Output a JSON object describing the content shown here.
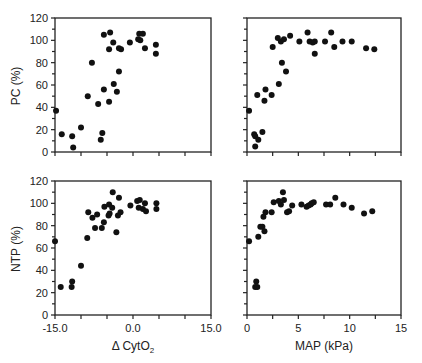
{
  "chart_data": [
    {
      "type": "scatter",
      "panel": "top-left",
      "xlabel": "",
      "ylabel": "PC (%)",
      "xlim": [
        -15,
        15
      ],
      "ylim": [
        0,
        120
      ],
      "xticks": [
        -15,
        -10,
        -5,
        0,
        5,
        10,
        15
      ],
      "xtick_labels": [],
      "yticks": [
        0,
        20,
        40,
        60,
        80,
        100,
        120
      ],
      "ytick_labels": [
        "0",
        "20",
        "40",
        "60",
        "80",
        "100",
        "120"
      ],
      "grid": false,
      "points": [
        [
          -14.8,
          37
        ],
        [
          -13.7,
          16
        ],
        [
          -11.7,
          14
        ],
        [
          -11.5,
          4
        ],
        [
          -10.0,
          22
        ],
        [
          -8.7,
          50
        ],
        [
          -7.9,
          80
        ],
        [
          -6.7,
          43
        ],
        [
          -6.2,
          11
        ],
        [
          -5.9,
          17
        ],
        [
          -5.6,
          56
        ],
        [
          -5.6,
          105
        ],
        [
          -4.4,
          107
        ],
        [
          -4.6,
          45
        ],
        [
          -4.6,
          92
        ],
        [
          -3.8,
          98
        ],
        [
          -3.7,
          61
        ],
        [
          -3.1,
          54
        ],
        [
          -2.7,
          72
        ],
        [
          -2.7,
          93
        ],
        [
          -2.3,
          92
        ],
        [
          -0.6,
          98
        ],
        [
          1.0,
          101
        ],
        [
          1.2,
          106
        ],
        [
          1.9,
          106
        ],
        [
          1.4,
          100
        ],
        [
          2.3,
          93
        ],
        [
          4.4,
          96
        ],
        [
          4.4,
          88
        ]
      ]
    },
    {
      "type": "scatter",
      "panel": "top-right",
      "xlabel": "",
      "ylabel": "",
      "xlim": [
        0,
        15
      ],
      "ylim": [
        0,
        120
      ],
      "xticks": [
        0,
        2.5,
        5,
        7.5,
        10,
        12.5,
        15
      ],
      "xtick_labels": [],
      "yticks": [
        0,
        10,
        20,
        30,
        40,
        50,
        60,
        70,
        80,
        90,
        100,
        110,
        120
      ],
      "ytick_labels": [],
      "grid": false,
      "points": [
        [
          0.2,
          37
        ],
        [
          0.7,
          16
        ],
        [
          0.8,
          14
        ],
        [
          0.8,
          5
        ],
        [
          1.1,
          11
        ],
        [
          1.0,
          51
        ],
        [
          1.5,
          18
        ],
        [
          1.7,
          46
        ],
        [
          1.8,
          56
        ],
        [
          2.4,
          51
        ],
        [
          2.5,
          94
        ],
        [
          3.1,
          61
        ],
        [
          3.0,
          102
        ],
        [
          3.3,
          99
        ],
        [
          3.6,
          101
        ],
        [
          3.4,
          80
        ],
        [
          3.8,
          72
        ],
        [
          4.2,
          104
        ],
        [
          5.1,
          99
        ],
        [
          5.9,
          107
        ],
        [
          6.1,
          99
        ],
        [
          6.4,
          98
        ],
        [
          6.6,
          99
        ],
        [
          6.6,
          88
        ],
        [
          7.6,
          99
        ],
        [
          8.2,
          107
        ],
        [
          8.5,
          94
        ],
        [
          9.3,
          99
        ],
        [
          10.2,
          99
        ],
        [
          11.6,
          93
        ],
        [
          12.4,
          92
        ]
      ]
    },
    {
      "type": "scatter",
      "panel": "bottom-left",
      "xlabel": "Δ CytO2",
      "ylabel": "NTP (%)",
      "xlim": [
        -15,
        15
      ],
      "ylim": [
        0,
        120
      ],
      "xticks": [
        -15,
        -10,
        -5,
        0,
        5,
        10,
        15
      ],
      "xtick_labels": [
        "-15.0",
        "",
        "",
        "0.0",
        "",
        "",
        "15.0"
      ],
      "yticks": [
        0,
        20,
        40,
        60,
        80,
        100,
        120
      ],
      "ytick_labels": [
        "0",
        "20",
        "40",
        "60",
        "80",
        "100",
        "120"
      ],
      "grid": false,
      "points": [
        [
          -15.0,
          66
        ],
        [
          -13.9,
          25
        ],
        [
          -11.8,
          25
        ],
        [
          -11.7,
          30
        ],
        [
          -10.0,
          44
        ],
        [
          -8.8,
          69
        ],
        [
          -8.6,
          92
        ],
        [
          -7.8,
          87
        ],
        [
          -7.3,
          78
        ],
        [
          -6.9,
          90
        ],
        [
          -6.0,
          78
        ],
        [
          -5.6,
          83
        ],
        [
          -5.5,
          97
        ],
        [
          -4.6,
          99
        ],
        [
          -4.7,
          89
        ],
        [
          -4.5,
          91
        ],
        [
          -4.0,
          96
        ],
        [
          -3.9,
          110
        ],
        [
          -3.2,
          74
        ],
        [
          -2.9,
          89
        ],
        [
          -2.7,
          105
        ],
        [
          -2.4,
          92
        ],
        [
          -0.5,
          98
        ],
        [
          0.8,
          102
        ],
        [
          1.3,
          103
        ],
        [
          1.1,
          96
        ],
        [
          1.9,
          95
        ],
        [
          2.3,
          100
        ],
        [
          2.5,
          93
        ],
        [
          4.5,
          100
        ],
        [
          4.5,
          95
        ]
      ]
    },
    {
      "type": "scatter",
      "panel": "bottom-right",
      "xlabel": "MAP (kPa)",
      "ylabel": "",
      "xlim": [
        0,
        15
      ],
      "ylim": [
        0,
        120
      ],
      "xticks": [
        0,
        2.5,
        5,
        7.5,
        10,
        12.5,
        15
      ],
      "xtick_labels": [
        "0",
        "",
        "5",
        "",
        "10",
        "",
        "15"
      ],
      "yticks": [
        0,
        10,
        20,
        30,
        40,
        50,
        60,
        70,
        80,
        90,
        100,
        110,
        120
      ],
      "ytick_labels": [],
      "grid": false,
      "points": [
        [
          0.2,
          66
        ],
        [
          0.8,
          25
        ],
        [
          0.9,
          30
        ],
        [
          1.0,
          25
        ],
        [
          1.1,
          70
        ],
        [
          1.3,
          79
        ],
        [
          1.5,
          79
        ],
        [
          1.6,
          88
        ],
        [
          1.7,
          75
        ],
        [
          1.8,
          92
        ],
        [
          2.4,
          92
        ],
        [
          2.6,
          101
        ],
        [
          3.1,
          102
        ],
        [
          3.3,
          99
        ],
        [
          3.5,
          110
        ],
        [
          3.6,
          103
        ],
        [
          3.9,
          92
        ],
        [
          4.1,
          93
        ],
        [
          4.4,
          98
        ],
        [
          5.3,
          99
        ],
        [
          5.8,
          97
        ],
        [
          6.0,
          98
        ],
        [
          6.2,
          99
        ],
        [
          6.3,
          100
        ],
        [
          6.5,
          101
        ],
        [
          7.7,
          99
        ],
        [
          8.1,
          99
        ],
        [
          8.6,
          105
        ],
        [
          9.4,
          99
        ],
        [
          10.2,
          96
        ],
        [
          11.4,
          91
        ],
        [
          12.2,
          93
        ]
      ]
    }
  ],
  "labels": {
    "top_left_ylabel": "PC (%)",
    "bottom_left_ylabel": "NTP (%)",
    "bottom_left_xlabel_prefix": "Δ CytO",
    "bottom_left_xlabel_sub": "2",
    "bottom_right_xlabel": "MAP (kPa)"
  },
  "colors": {
    "marker": "#111111",
    "axis": "#222222",
    "background": "#ffffff"
  }
}
